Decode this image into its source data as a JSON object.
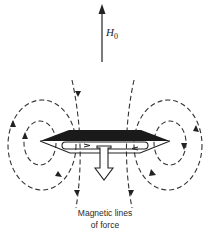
{
  "diagram": {
    "field_label": "H",
    "field_subscript": "0",
    "caption_line1": "Magnetic lines",
    "caption_line2": "of force",
    "colors": {
      "ink": "#222222",
      "background": "#ffffff"
    }
  }
}
